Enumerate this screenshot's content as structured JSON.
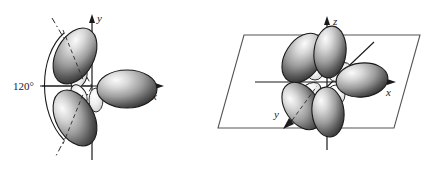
{
  "figure": {
    "title": "",
    "panels": [
      {
        "id": "sp2-planar-orbital",
        "position": "left",
        "orbital_type": "sp2",
        "description": "Three sp2 hybrid orbital lobes arranged in the xy-plane",
        "axes": [
          {
            "name": "y-axis",
            "label": "y",
            "direction": "up"
          },
          {
            "name": "x-axis",
            "label": "x",
            "direction": "right"
          }
        ],
        "annotations": [
          {
            "name": "bond-angle",
            "label": "120°"
          }
        ],
        "lobe_count": 3,
        "lobe_angles_deg": [
          0,
          120,
          240
        ],
        "colors": {
          "lobe_light": "#f2f2f2",
          "lobe_mid": "#9a9a9a",
          "lobe_dark": "#3c3c3c",
          "outline": "#1a1a1a",
          "axis": "#1a1a1a",
          "guide": "#2b2b2b"
        }
      },
      {
        "id": "sp3-3d-orbital",
        "position": "right",
        "orbital_type": "sp3",
        "description": "Hybrid orbital lobes drawn in three dimensions with a reference plane parallelogram",
        "axes": [
          {
            "name": "z-axis",
            "label": "z",
            "direction": "up"
          },
          {
            "name": "x-axis",
            "label": "x",
            "direction": "right"
          },
          {
            "name": "y-axis",
            "label": "y",
            "direction": "down-left"
          }
        ],
        "annotations": [],
        "lobe_count": 4,
        "plane": "xy-plane parallelogram",
        "colors": {
          "lobe_light": "#f2f2f2",
          "lobe_mid": "#9a9a9a",
          "lobe_dark": "#3c3c3c",
          "outline": "#1a1a1a",
          "axis": "#1a1a1a",
          "plane_edge": "#555555"
        }
      }
    ]
  }
}
